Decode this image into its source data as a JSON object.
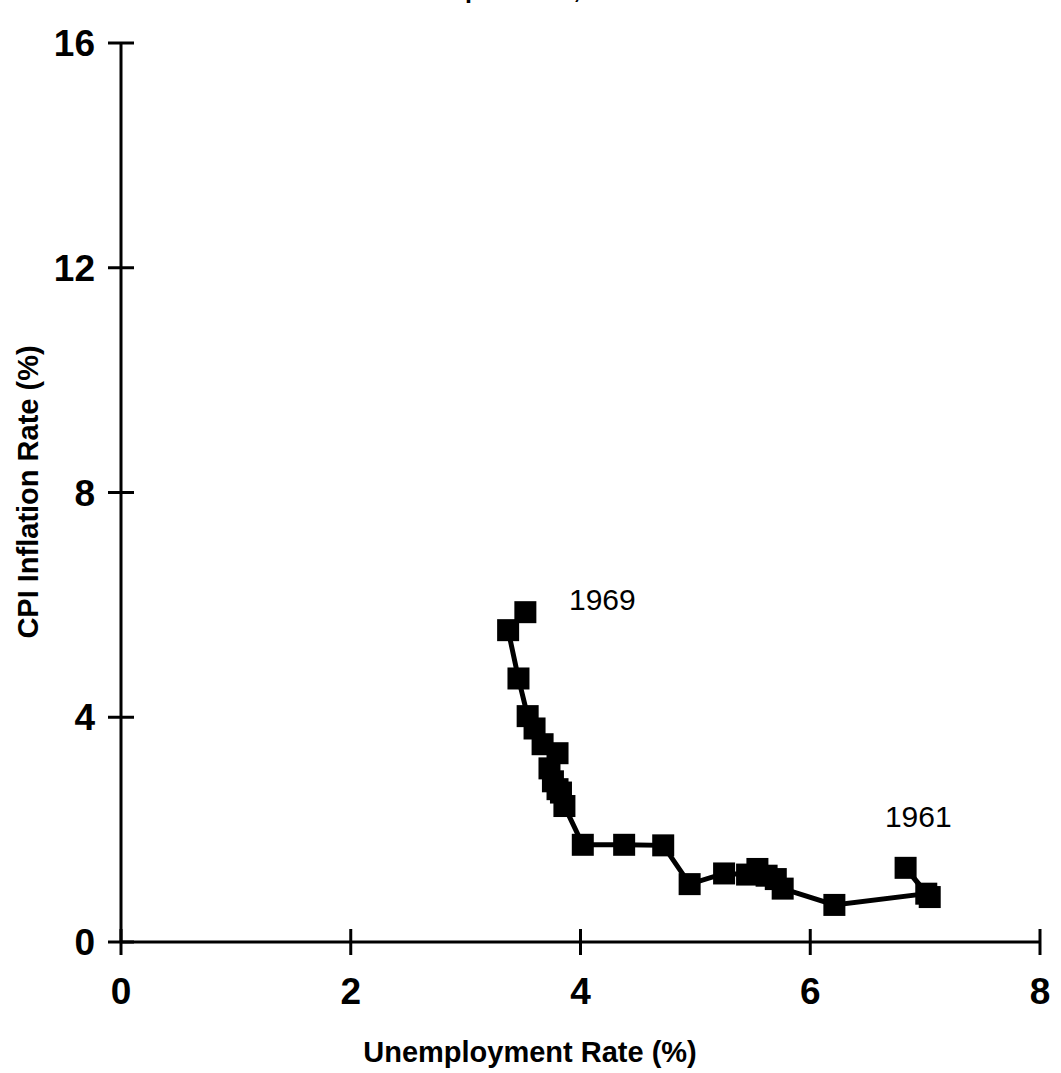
{
  "figure": {
    "title_partial": "The Phillips Curve, 1961-1969",
    "background_color": "#ffffff",
    "ink_color": "#000000"
  },
  "chart_data": {
    "type": "line",
    "title": "The Phillips Curve, 1961-1969",
    "xlabel": "Unemployment Rate (%)",
    "ylabel": "CPI Inflation Rate (%)",
    "xlim": [
      0,
      8
    ],
    "ylim": [
      0,
      16
    ],
    "xticks": [
      0,
      2,
      4,
      6,
      8
    ],
    "yticks": [
      0,
      4,
      8,
      12,
      16
    ],
    "grid": false,
    "legend": "none",
    "marker": "filled-square",
    "marker_color": "#000000",
    "line_color": "#000000",
    "series": [
      {
        "name": "US CPI inflation vs unemployment, 1961-1969 (monthly/quarterly path)",
        "points": [
          {
            "x": 7.04,
            "y": 0.8
          },
          {
            "x": 6.83,
            "y": 1.32
          },
          {
            "x": 7.01,
            "y": 0.86
          },
          {
            "x": 6.21,
            "y": 0.66
          },
          {
            "x": 5.76,
            "y": 0.95
          },
          {
            "x": 5.7,
            "y": 1.12
          },
          {
            "x": 5.62,
            "y": 1.18
          },
          {
            "x": 5.54,
            "y": 1.3
          },
          {
            "x": 5.45,
            "y": 1.2
          },
          {
            "x": 5.25,
            "y": 1.22
          },
          {
            "x": 4.95,
            "y": 1.03
          },
          {
            "x": 4.72,
            "y": 1.72
          },
          {
            "x": 4.38,
            "y": 1.73
          },
          {
            "x": 4.02,
            "y": 1.73
          },
          {
            "x": 3.86,
            "y": 2.42
          },
          {
            "x": 3.83,
            "y": 2.66
          },
          {
            "x": 3.8,
            "y": 2.72
          },
          {
            "x": 3.76,
            "y": 2.86
          },
          {
            "x": 3.73,
            "y": 3.09
          },
          {
            "x": 3.8,
            "y": 3.36
          },
          {
            "x": 3.67,
            "y": 3.52
          },
          {
            "x": 3.6,
            "y": 3.8
          },
          {
            "x": 3.54,
            "y": 4.02
          },
          {
            "x": 3.46,
            "y": 4.69
          },
          {
            "x": 3.37,
            "y": 5.55
          },
          {
            "x": 3.52,
            "y": 5.87
          }
        ]
      }
    ],
    "annotations": [
      {
        "text": "1969",
        "x": 3.9,
        "y": 5.9,
        "anchor": "start"
      },
      {
        "text": "1961",
        "x": 6.65,
        "y": 2.05,
        "anchor": "start"
      }
    ]
  },
  "axes": {
    "x_tick_labels": [
      "0",
      "2",
      "4",
      "6",
      "8"
    ],
    "y_tick_labels": [
      "0",
      "4",
      "8",
      "12",
      "16"
    ],
    "x_axis_title": "Unemployment Rate (%)",
    "y_axis_title": "CPI Inflation Rate (%)"
  }
}
